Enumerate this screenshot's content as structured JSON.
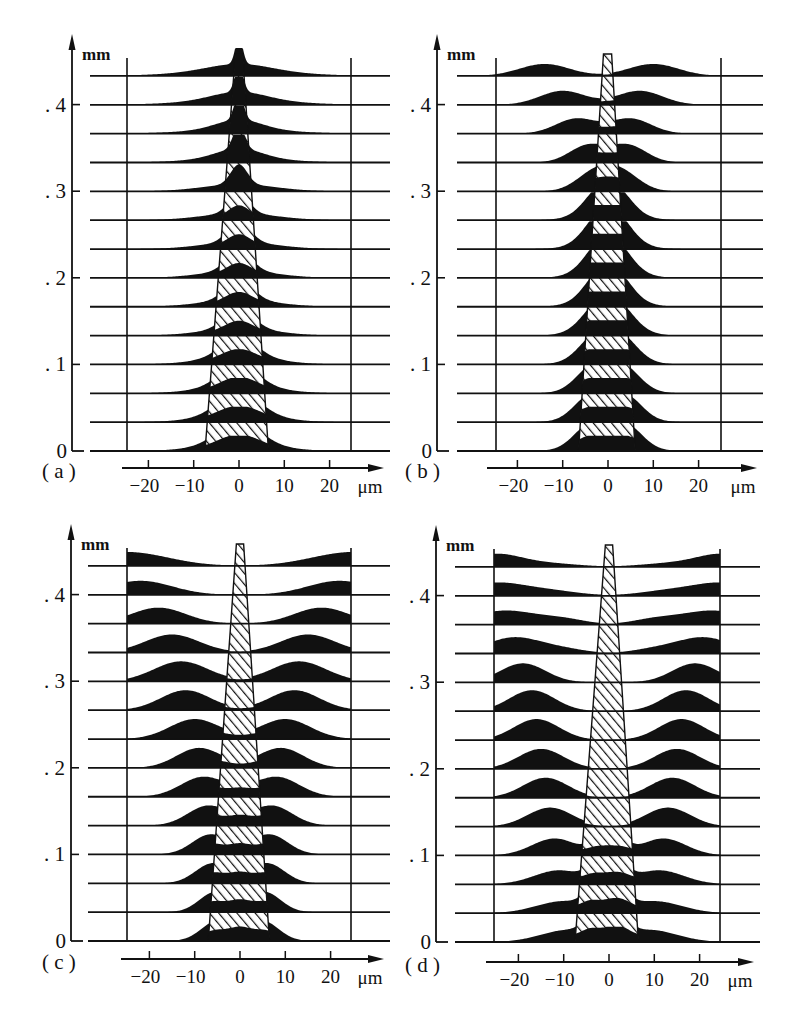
{
  "figure": {
    "panels": [
      {
        "id": "a",
        "label": "( a )"
      },
      {
        "id": "b",
        "label": "( b )"
      },
      {
        "id": "c",
        "label": "( c )"
      },
      {
        "id": "d",
        "label": "( d )"
      }
    ],
    "y_unit": "mm",
    "x_unit": "μm",
    "y_tick_labels": [
      "0",
      ". 1",
      ". 2",
      ". 3",
      ". 4"
    ],
    "x_tick_labels": [
      "−20",
      "−10",
      "0",
      "10",
      "20"
    ]
  },
  "chart_data": [
    {
      "type": "area",
      "title": "(a)",
      "description": "Stacked transverse intensity profiles along propagation distance; hatched central core region",
      "xlabel": "μm",
      "ylabel": "mm",
      "x_ticks": [
        -20,
        -10,
        0,
        10,
        20
      ],
      "y_ticks": [
        0,
        0.1,
        0.2,
        0.3,
        0.4
      ],
      "xlim": [
        -25,
        25
      ],
      "ylim": [
        0,
        0.45
      ],
      "baseline_step_mm": 0.0333,
      "rows": 14,
      "clip_to_bounds": false,
      "core": {
        "bottom": [
          -7.5,
          6.5
        ],
        "top": [
          -0.8,
          0.8
        ],
        "hatched_until_row": 9
      },
      "profiles": [
        [
          [
            0,
            4.5,
            22
          ],
          [
            0,
            8,
            8
          ]
        ],
        [
          [
            0,
            4.5,
            22
          ],
          [
            0,
            8,
            8
          ]
        ],
        [
          [
            0,
            4,
            22
          ],
          [
            0,
            8,
            8
          ]
        ],
        [
          [
            0,
            3.8,
            20
          ],
          [
            0,
            8,
            8
          ]
        ],
        [
          [
            0,
            3.2,
            20
          ],
          [
            0,
            8,
            7
          ]
        ],
        [
          [
            0,
            3,
            20
          ],
          [
            0,
            8,
            7
          ]
        ],
        [
          [
            0,
            2.8,
            20
          ],
          [
            0,
            8,
            7
          ]
        ],
        [
          [
            0,
            2.5,
            20
          ],
          [
            0,
            8,
            7
          ]
        ],
        [
          [
            0,
            2.2,
            20
          ],
          [
            0,
            8,
            7
          ]
        ],
        [
          [
            0,
            1.8,
            20
          ],
          [
            0,
            8,
            7
          ]
        ],
        [
          [
            0,
            1.2,
            24
          ],
          [
            0,
            5,
            10
          ],
          [
            0,
            10,
            4
          ]
        ],
        [
          [
            0,
            1,
            26
          ],
          [
            0,
            5,
            10
          ],
          [
            0,
            11,
            4
          ]
        ],
        [
          [
            0,
            0.9,
            27
          ],
          [
            0,
            6,
            9
          ],
          [
            0,
            12,
            4
          ]
        ],
        [
          [
            0,
            0.8,
            28
          ],
          [
            0,
            7,
            8
          ],
          [
            0,
            13,
            4
          ]
        ]
      ]
    },
    {
      "type": "area",
      "title": "(b)",
      "xlabel": "μm",
      "ylabel": "mm",
      "x_ticks": [
        -20,
        -10,
        0,
        10,
        20
      ],
      "y_ticks": [
        0,
        0.1,
        0.2,
        0.3,
        0.4
      ],
      "xlim": [
        -25,
        25
      ],
      "ylim": [
        0,
        0.45
      ],
      "baseline_step_mm": 0.0333,
      "rows": 14,
      "clip_to_bounds": false,
      "core": {
        "bottom": [
          -6.5,
          6
        ],
        "top": [
          -1,
          0.8
        ],
        "hatched_until_row": 13
      },
      "profiles": [
        [
          [
            -4,
            3.5,
            22
          ],
          [
            4,
            3.5,
            22
          ],
          [
            0,
            6,
            6
          ]
        ],
        [
          [
            -4,
            3.5,
            22
          ],
          [
            4,
            3.5,
            22
          ],
          [
            0,
            6,
            6
          ]
        ],
        [
          [
            -3.5,
            3.5,
            22
          ],
          [
            3.5,
            3.5,
            22
          ],
          [
            0,
            6,
            6
          ]
        ],
        [
          [
            -3,
            3.5,
            22
          ],
          [
            3,
            3.5,
            22
          ],
          [
            0,
            6,
            6
          ]
        ],
        [
          [
            -2.5,
            3.5,
            22
          ],
          [
            2.5,
            3.5,
            22
          ],
          [
            0,
            6,
            6
          ]
        ],
        [
          [
            -2,
            3.5,
            22
          ],
          [
            2,
            3.5,
            22
          ],
          [
            0,
            6,
            6
          ]
        ],
        [
          [
            -2,
            3.5,
            22
          ],
          [
            2,
            3.5,
            22
          ],
          [
            0,
            6,
            6
          ]
        ],
        [
          [
            -2,
            3.5,
            22
          ],
          [
            2,
            3.5,
            22
          ],
          [
            0,
            6,
            6
          ]
        ],
        [
          [
            -2,
            3.5,
            20
          ],
          [
            2,
            3.5,
            20
          ],
          [
            0,
            6,
            6
          ]
        ],
        [
          [
            -3,
            4,
            18
          ],
          [
            3,
            4,
            18
          ]
        ],
        [
          [
            -4.5,
            4,
            17
          ],
          [
            4.5,
            4,
            17
          ]
        ],
        [
          [
            -7,
            4.5,
            15
          ],
          [
            5,
            4.5,
            15
          ]
        ],
        [
          [
            -10,
            5,
            14
          ],
          [
            7,
            5,
            14
          ]
        ],
        [
          [
            -14,
            5.5,
            12
          ],
          [
            10,
            5.5,
            12
          ]
        ]
      ]
    },
    {
      "type": "area",
      "title": "(c)",
      "xlabel": "μm",
      "ylabel": "mm",
      "x_ticks": [
        -20,
        -10,
        0,
        10,
        20
      ],
      "y_ticks": [
        0,
        0.1,
        0.2,
        0.3,
        0.4
      ],
      "xlim": [
        -25,
        25
      ],
      "ylim": [
        0,
        0.45
      ],
      "baseline_step_mm": 0.0333,
      "rows": 14,
      "clip_to_bounds": true,
      "core": {
        "bottom": [
          -7,
          6.5
        ],
        "top": [
          -0.8,
          0.8
        ],
        "hatched_until_row": 13
      },
      "profiles": [
        [
          [
            -5,
            3.5,
            20
          ],
          [
            5,
            3.5,
            20
          ],
          [
            0,
            2,
            12
          ]
        ],
        [
          [
            -5.5,
            3.5,
            20
          ],
          [
            5.5,
            3.5,
            20
          ],
          [
            0,
            2,
            12
          ]
        ],
        [
          [
            -6,
            3.8,
            20
          ],
          [
            6,
            3.8,
            20
          ],
          [
            0,
            2,
            10
          ]
        ],
        [
          [
            -6.5,
            4,
            20
          ],
          [
            6.5,
            4,
            20
          ],
          [
            0,
            2,
            10
          ]
        ],
        [
          [
            -7,
            4.5,
            20
          ],
          [
            7,
            4.5,
            20
          ],
          [
            0,
            2,
            8
          ]
        ],
        [
          [
            -8,
            5,
            20
          ],
          [
            8,
            5,
            20
          ],
          [
            0,
            2,
            6
          ]
        ],
        [
          [
            -9,
            5,
            20
          ],
          [
            9,
            5,
            20
          ]
        ],
        [
          [
            -10,
            5.5,
            20
          ],
          [
            10,
            5.5,
            20
          ]
        ],
        [
          [
            -12,
            5.5,
            20
          ],
          [
            12,
            5.5,
            20
          ]
        ],
        [
          [
            -13,
            6,
            20
          ],
          [
            13,
            6,
            20
          ]
        ],
        [
          [
            -15,
            6,
            18
          ],
          [
            15,
            6,
            18
          ]
        ],
        [
          [
            -18,
            6,
            16
          ],
          [
            18,
            6,
            16
          ]
        ],
        [
          [
            -22,
            7,
            14
          ],
          [
            22,
            7,
            14
          ]
        ],
        [
          [
            -25,
            9,
            14
          ],
          [
            25,
            9,
            14
          ]
        ]
      ]
    },
    {
      "type": "area",
      "title": "(d)",
      "xlabel": "μm",
      "ylabel": "mm",
      "x_ticks": [
        -20,
        -10,
        0,
        10,
        20
      ],
      "y_ticks": [
        0,
        0.1,
        0.2,
        0.3,
        0.4
      ],
      "xlim": [
        -25,
        25
      ],
      "ylim": [
        0,
        0.45
      ],
      "baseline_step_mm": 0.0333,
      "rows": 14,
      "clip_to_bounds": true,
      "core": {
        "bottom": [
          -7.5,
          6.5
        ],
        "top": [
          -0.8,
          0.8
        ],
        "hatched_until_row": 13
      },
      "profiles": [
        [
          [
            -4,
            2,
            14
          ],
          [
            0,
            2,
            14
          ],
          [
            3,
            2,
            14
          ],
          [
            -9,
            6,
            12
          ],
          [
            9,
            6,
            12
          ]
        ],
        [
          [
            -4,
            2,
            14
          ],
          [
            0,
            2,
            14
          ],
          [
            3,
            2,
            14
          ],
          [
            -10,
            6,
            12
          ],
          [
            10,
            6,
            12
          ]
        ],
        [
          [
            -3.5,
            2,
            12
          ],
          [
            0,
            2,
            12
          ],
          [
            3,
            2,
            12
          ],
          [
            -11,
            5.5,
            14
          ],
          [
            11,
            5.5,
            14
          ]
        ],
        [
          [
            -3,
            2,
            10
          ],
          [
            0,
            2,
            10
          ],
          [
            3,
            2,
            10
          ],
          [
            -12,
            5,
            17
          ],
          [
            12,
            5,
            17
          ]
        ],
        [
          [
            -13,
            5,
            19
          ],
          [
            13,
            5,
            19
          ]
        ],
        [
          [
            -14,
            5,
            20
          ],
          [
            14,
            5,
            20
          ]
        ],
        [
          [
            -15,
            5,
            20
          ],
          [
            15,
            5,
            20
          ]
        ],
        [
          [
            -16,
            5,
            21
          ],
          [
            16,
            5,
            21
          ]
        ],
        [
          [
            -17,
            5,
            21
          ],
          [
            17,
            5,
            21
          ]
        ],
        [
          [
            -19,
            5,
            19
          ],
          [
            19,
            5,
            19
          ]
        ],
        [
          [
            -21,
            6,
            16
          ],
          [
            21,
            6,
            16
          ],
          [
            -10,
            5,
            4
          ],
          [
            10,
            5,
            4
          ]
        ],
        [
          [
            -23,
            7,
            14
          ],
          [
            23,
            7,
            14
          ],
          [
            -10,
            5,
            5
          ],
          [
            10,
            5,
            5
          ]
        ],
        [
          [
            -25,
            7,
            13
          ],
          [
            25,
            7,
            13
          ],
          [
            -12,
            6,
            4
          ],
          [
            12,
            6,
            4
          ]
        ],
        [
          [
            -25,
            6,
            13
          ],
          [
            25,
            6,
            13
          ],
          [
            -12,
            6,
            3
          ],
          [
            12,
            6,
            3
          ]
        ]
      ]
    }
  ]
}
